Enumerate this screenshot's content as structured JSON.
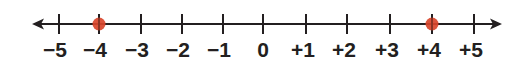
{
  "diagram": {
    "type": "number-line",
    "range": [
      -5,
      5
    ],
    "tick_labels": [
      "−5",
      "−4",
      "−3",
      "−2",
      "−1",
      "0",
      "+1",
      "+2",
      "+3",
      "+4",
      "+5"
    ],
    "tick_values": [
      -5,
      -4,
      -3,
      -2,
      -1,
      0,
      1,
      2,
      3,
      4,
      5
    ],
    "tick_x": [
      59,
      99,
      141,
      182,
      223,
      263,
      306,
      347,
      390,
      432,
      474
    ],
    "label_offsets": [
      -4,
      -4,
      -4,
      -4,
      -4,
      0,
      -3,
      -3,
      -3,
      -3,
      -3
    ],
    "points": [
      {
        "value": -4,
        "color": "#d9452b"
      },
      {
        "value": 4,
        "color": "#d9452b"
      }
    ],
    "arrows": [
      "left",
      "right"
    ],
    "line_color": "#231f20"
  }
}
